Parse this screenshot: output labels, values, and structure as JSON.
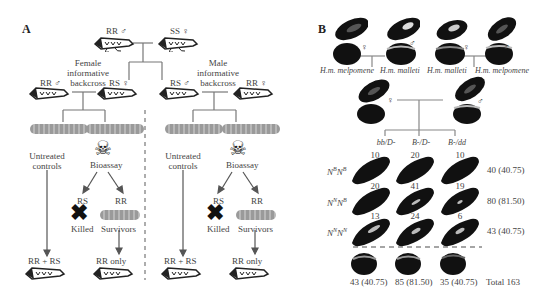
{
  "panel_a": {
    "letter": "A",
    "parents": {
      "male": "RR ♂",
      "female": "SS ♀"
    },
    "female_backcross": {
      "title_line1": "Female",
      "title_line2": "informative",
      "title_line3": "backcross",
      "parent_male": "RR ♂",
      "parent_female": "RS ♀"
    },
    "male_backcross": {
      "title_line1": "Male",
      "title_line2": "informative",
      "title_line3": "backcross",
      "parent_male": "RS ♂",
      "parent_female": "RR ♀"
    },
    "untreated": {
      "line1": "Untreated",
      "line2": "controls"
    },
    "bioassay": "Bioassay",
    "rs": "RS",
    "rr": "RR",
    "killed": "Killed",
    "survivors": "Survivors",
    "result_control": "RR + RS",
    "result_survivors": "RR only"
  },
  "panel_b": {
    "letter": "B",
    "cross1": {
      "female_label": "H.m. melpomene",
      "male_label": "H.m. malleti"
    },
    "cross2": {
      "female_label": "H.m. malleti",
      "male_label": "H.m. melpomene"
    },
    "female_symbol": "♀",
    "male_symbol": "♂",
    "genotype_columns": [
      "bb/D-",
      "B-/D-",
      "B-/dd"
    ],
    "rows": [
      {
        "genotype": "N",
        "sup1": "B",
        "g2": "N",
        "sup2": "B",
        "counts": [
          "10",
          "20",
          "10"
        ],
        "total": "40 (40.75)"
      },
      {
        "genotype": "N",
        "sup1": "N",
        "g2": "N",
        "sup2": "B",
        "counts": [
          "20",
          "41",
          "19"
        ],
        "total": "80 (81.50)"
      },
      {
        "genotype": "N",
        "sup1": "N",
        "g2": "N",
        "sup2": "N",
        "counts": [
          "13",
          "24",
          "6"
        ],
        "total": "43 (40.75)"
      }
    ],
    "column_totals": [
      "43 (40.75)",
      "85 (81.50)",
      "35 (40.75)"
    ],
    "grand_total": "Total 163"
  }
}
